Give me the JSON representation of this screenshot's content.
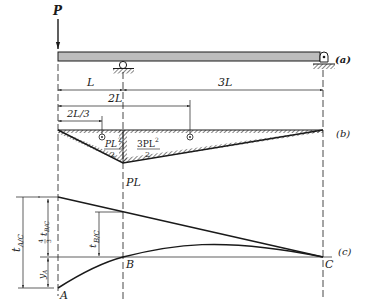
{
  "figure": {
    "part_labels": {
      "a": "(a)",
      "b": "(b)",
      "c": "(c)"
    },
    "load": {
      "label": "P"
    },
    "dimensions": {
      "L": "L",
      "two_L": "2L",
      "three_L": "3L",
      "two_L_third": "2L/3"
    },
    "moment_diagram": {
      "left_area_num": "PL",
      "left_area_exp": "2",
      "left_area_den": "2",
      "right_area_num": "3PL",
      "right_area_exp": "2",
      "right_area_den": "2",
      "peak_label": "PL"
    },
    "deflection": {
      "point_A": "A",
      "point_B": "B",
      "point_C": "C",
      "t_AC": "t",
      "t_AC_sub": "A/C",
      "t_BC": "t",
      "t_BC_sub": "B/C",
      "four_thirds_num": "4",
      "four_thirds_den": "3",
      "four_thirds_t": "t",
      "four_thirds_sub": "B/C",
      "y_A": "y",
      "y_A_sub": "A"
    },
    "colors": {
      "ink": "#1a1a1a",
      "beam_fill": "#bdbdbd",
      "hatch": "#333333"
    }
  }
}
